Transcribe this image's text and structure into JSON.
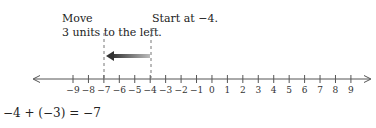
{
  "annotations": {
    "move_line1": "Move",
    "move_line2": "3 units to the left.",
    "start": "Start at −4."
  },
  "number_line": {
    "min": -9,
    "max": 9,
    "tick_labels": [
      "−9",
      "−8",
      "−7",
      "−6",
      "−5",
      "−4",
      "−3",
      "−2",
      "−1",
      "0",
      "1",
      "2",
      "3",
      "4",
      "5",
      "6",
      "7",
      "8",
      "9"
    ],
    "start_value": -4,
    "end_value": -7,
    "move": -3,
    "arrow_direction": "left"
  },
  "equation": "−4 + (−3) = −7",
  "colors": {
    "axis": "#555555",
    "arrow": "#444444",
    "dashed": "#777777"
  }
}
